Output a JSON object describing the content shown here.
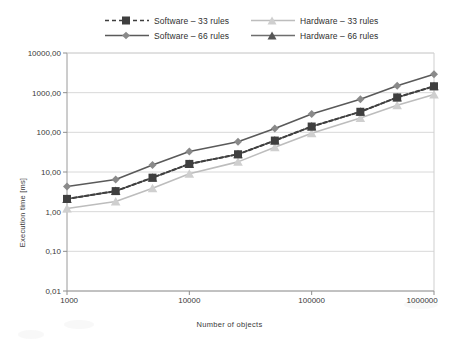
{
  "chart_data": {
    "type": "line",
    "title": "",
    "xlabel": "Number of objects",
    "ylabel": "Execution time [ms]",
    "xscale": "log",
    "yscale": "log",
    "xlim": [
      1000,
      1000000
    ],
    "ylim": [
      0.01,
      10000
    ],
    "grid": true,
    "legend_position": "top",
    "x": [
      1000,
      2500,
      5000,
      10000,
      25000,
      50000,
      100000,
      250000,
      500000,
      1000000
    ],
    "xtick_labels": [
      "1000",
      "10000",
      "100000",
      "1000000"
    ],
    "xtick_values": [
      1000,
      10000,
      100000,
      1000000
    ],
    "ytick_labels": [
      "10000,00",
      "1000,00",
      "100,00",
      "10,00",
      "1,00",
      "0,10",
      "0,01"
    ],
    "ytick_values": [
      10000,
      1000,
      100,
      10,
      1,
      0.1,
      0.01
    ],
    "series": [
      {
        "name": "Software – 33 rules",
        "color": "#3f3f3f",
        "dash": "dashed",
        "marker": "square",
        "values": [
          2.1,
          3.3,
          7.2,
          16.0,
          28.0,
          62.0,
          140.0,
          330.0,
          760.0,
          1450.0
        ]
      },
      {
        "name": "Hardware – 33 rules",
        "color": "#bdbdbd",
        "dash": "solid",
        "marker": "triangle",
        "values": [
          1.2,
          1.8,
          3.9,
          9.0,
          18.0,
          42.0,
          95.0,
          230.0,
          480.0,
          900.0
        ]
      },
      {
        "name": "Software – 66 rules",
        "color": "#5a5a5a",
        "dash": "solid",
        "marker": "diamond",
        "values": [
          4.3,
          6.5,
          15.0,
          33.0,
          58.0,
          125.0,
          290.0,
          680.0,
          1500.0,
          2900.0
        ]
      },
      {
        "name": "Hardware – 66 rules",
        "color": "#6e6e6e",
        "dash": "solid",
        "marker": "triangle",
        "values": [
          2.1,
          3.3,
          7.2,
          16.0,
          28.0,
          62.0,
          140.0,
          330.0,
          760.0,
          1450.0
        ]
      }
    ]
  },
  "legend": {
    "rows": [
      [
        "Software – 33 rules",
        "Hardware – 33 rules"
      ],
      [
        "Software – 66 rules",
        "Hardware – 66 rules"
      ]
    ]
  }
}
